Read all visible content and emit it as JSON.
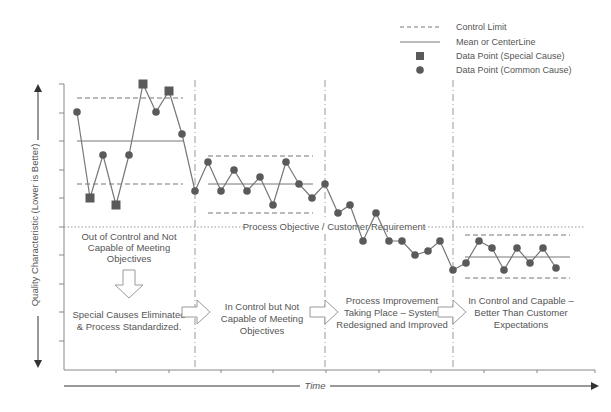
{
  "chart_data": {
    "type": "line",
    "title": "",
    "xlabel": "Time",
    "ylabel": "Quality Characteristic (Lower is Better)",
    "grid": false,
    "legend_position": "top-right",
    "legend": [
      {
        "key": "control_limit",
        "label": "Control Limit",
        "style": "dashed-line"
      },
      {
        "key": "mean",
        "label": "Mean or CenterLine",
        "style": "solid-line"
      },
      {
        "key": "special",
        "label": "Data Point (Special Cause)",
        "style": "square"
      },
      {
        "key": "common",
        "label": "Data Point (Common Cause)",
        "style": "circle"
      }
    ],
    "objective_line": {
      "label": "Process Objective / Customer Requirement",
      "y_px": 227
    },
    "axis_px": {
      "x0": 64,
      "x1": 595,
      "y0": 370,
      "ytop": 84,
      "y_ticks": [
        84,
        113,
        141,
        170,
        198,
        227,
        255,
        284,
        312,
        341
      ],
      "x_ticks": [
        116,
        169,
        221,
        273,
        326,
        379,
        431,
        484,
        537,
        595
      ]
    },
    "separators_px": [
      195,
      325,
      453
    ],
    "phases": [
      {
        "name": "Phase 1",
        "ucl_px": 98,
        "cl_px": 141,
        "lcl_px": 184,
        "x_from": 77,
        "x_to": 183,
        "upper_text": "Out of Control and Not|Capable of Meeting|Objectives",
        "lower_text": "Special Causes Eliminated|& Process Standardized."
      },
      {
        "name": "Phase 2",
        "ucl_px": 156,
        "cl_px": 184,
        "lcl_px": 213,
        "x_from": 208,
        "x_to": 313,
        "lower_text": "In Control but Not|Capable of Meeting|Objectives"
      },
      {
        "name": "Phase 3",
        "lower_text": "Process Improvement|Taking Place – System|Redesigned and Improved"
      },
      {
        "name": "Phase 4",
        "ucl_px": 235,
        "cl_px": 257,
        "lcl_px": 278,
        "x_from": 465,
        "x_to": 570,
        "lower_text": "In Control and Capable –|Better Than Customer|Expectations"
      }
    ],
    "points": [
      [
        77,
        112,
        "c"
      ],
      [
        90,
        198,
        "s"
      ],
      [
        103,
        155,
        "c"
      ],
      [
        116,
        205,
        "s"
      ],
      [
        129,
        155,
        "c"
      ],
      [
        143,
        84,
        "s"
      ],
      [
        156,
        112,
        "c"
      ],
      [
        169,
        91,
        "s"
      ],
      [
        182,
        134,
        "c"
      ],
      [
        195,
        191,
        "c"
      ],
      [
        208,
        162,
        "c"
      ],
      [
        221,
        191,
        "c"
      ],
      [
        234,
        170,
        "c"
      ],
      [
        247,
        191,
        "c"
      ],
      [
        260,
        177,
        "c"
      ],
      [
        273,
        205,
        "c"
      ],
      [
        286,
        162,
        "c"
      ],
      [
        299,
        184,
        "c"
      ],
      [
        312,
        198,
        "c"
      ],
      [
        325,
        184,
        "c"
      ],
      [
        338,
        213,
        "c"
      ],
      [
        350,
        205,
        "c"
      ],
      [
        363,
        241,
        "c"
      ],
      [
        376,
        213,
        "c"
      ],
      [
        389,
        241,
        "c"
      ],
      [
        402,
        241,
        "c"
      ],
      [
        415,
        255,
        "c"
      ],
      [
        428,
        251,
        "c"
      ],
      [
        440,
        241,
        "c"
      ],
      [
        453,
        270,
        "c"
      ],
      [
        466,
        263,
        "c"
      ],
      [
        479,
        241,
        "c"
      ],
      [
        492,
        248,
        "c"
      ],
      [
        504,
        270,
        "c"
      ],
      [
        517,
        248,
        "c"
      ],
      [
        530,
        263,
        "c"
      ],
      [
        543,
        248,
        "c"
      ],
      [
        556,
        268,
        "c"
      ]
    ]
  },
  "colors": {
    "point": "#5a5a5a",
    "line": "#777777",
    "axis": "#888888",
    "text": "#555555",
    "arrow_outline": "#9a9a9a"
  }
}
